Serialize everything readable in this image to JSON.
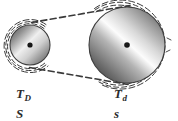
{
  "figure": {
    "background_color": "#ffffff",
    "ink_color": "#2b2b2b",
    "width": 178,
    "height": 121
  },
  "diagram": {
    "type": "belt-drive",
    "belt": {
      "style": "dashed",
      "dash_pattern": "5 3",
      "color": "#3a3a3a",
      "wrap_arcs": 3
    },
    "pulleys": [
      {
        "id": "driver",
        "role": "driver",
        "name": "small-pulley",
        "cx": 30,
        "cy": 45,
        "radius": 20,
        "hub_radius": 2.6,
        "gradient": {
          "type": "linear",
          "angle_deg": 135,
          "stops": [
            "#4a4a4a",
            "#9c9c9c",
            "#f2f2f2",
            "#b8b8b8",
            "#6e6e6e"
          ]
        }
      },
      {
        "id": "driven",
        "role": "driven",
        "name": "large-pulley",
        "cx": 127,
        "cy": 45,
        "radius": 38,
        "hub_radius": 2.8,
        "gradient": {
          "type": "linear",
          "angle_deg": 135,
          "stops": [
            "#3f3f3f",
            "#8e8e8e",
            "#fbfbfb",
            "#c2c2c2",
            "#5c5c5c"
          ]
        }
      }
    ]
  },
  "labels": {
    "left": {
      "torque_symbol": "T",
      "torque_subscript": "D",
      "speed_symbol": "S"
    },
    "right": {
      "torque_symbol": "T",
      "torque_subscript": "d",
      "speed_symbol": "s"
    }
  }
}
